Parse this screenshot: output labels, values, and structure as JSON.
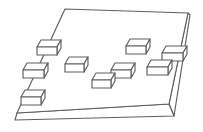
{
  "figure": {
    "background_color": "#ffffff",
    "stroke_color": "#5e5e5e",
    "fill_color": "#ffffff",
    "stroke_width": 1.15,
    "canvas": {
      "width": 203,
      "height": 132
    },
    "plate": {
      "top_face": [
        [
          65,
          9
        ],
        [
          188,
          13
        ],
        [
          169,
          104
        ],
        [
          17,
          113
        ]
      ],
      "front_face": [
        [
          17,
          113
        ],
        [
          169,
          104
        ],
        [
          174,
          116
        ],
        [
          15,
          120
        ]
      ],
      "right_face": [
        [
          188,
          13
        ],
        [
          169,
          104
        ],
        [
          174,
          116
        ],
        [
          190,
          15
        ]
      ]
    },
    "block_style": {
      "depth_dx": 4,
      "depth_dy": 7,
      "front_height": 8
    },
    "blocks": [
      {
        "id": "block-top-left",
        "x": 37,
        "y": 40,
        "w": 24,
        "h": 15
      },
      {
        "id": "block-left-edge",
        "x": 23,
        "y": 63,
        "w": 25,
        "h": 15
      },
      {
        "id": "block-bottom-left",
        "x": 21,
        "y": 90,
        "w": 24,
        "h": 15
      },
      {
        "id": "block-center-left",
        "x": 65,
        "y": 57,
        "w": 23,
        "h": 15
      },
      {
        "id": "block-center",
        "x": 92,
        "y": 73,
        "w": 23,
        "h": 15
      },
      {
        "id": "block-center-right",
        "x": 111,
        "y": 63,
        "w": 24,
        "h": 15
      },
      {
        "id": "block-top-right",
        "x": 126,
        "y": 39,
        "w": 24,
        "h": 15
      },
      {
        "id": "block-right",
        "x": 147,
        "y": 60,
        "w": 25,
        "h": 15
      },
      {
        "id": "block-far-right-edge",
        "x": 162,
        "y": 46,
        "w": 25,
        "h": 15
      }
    ]
  }
}
